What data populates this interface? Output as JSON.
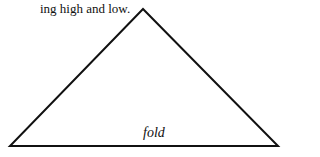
{
  "text": {
    "caption": "ing high and low.",
    "fold_label": "fold"
  },
  "diagram": {
    "shape": "triangle",
    "stroke_color": "#111111",
    "vertices": {
      "apex": [
        143,
        9
      ],
      "left": [
        10,
        146
      ],
      "right": [
        278,
        146
      ]
    }
  }
}
